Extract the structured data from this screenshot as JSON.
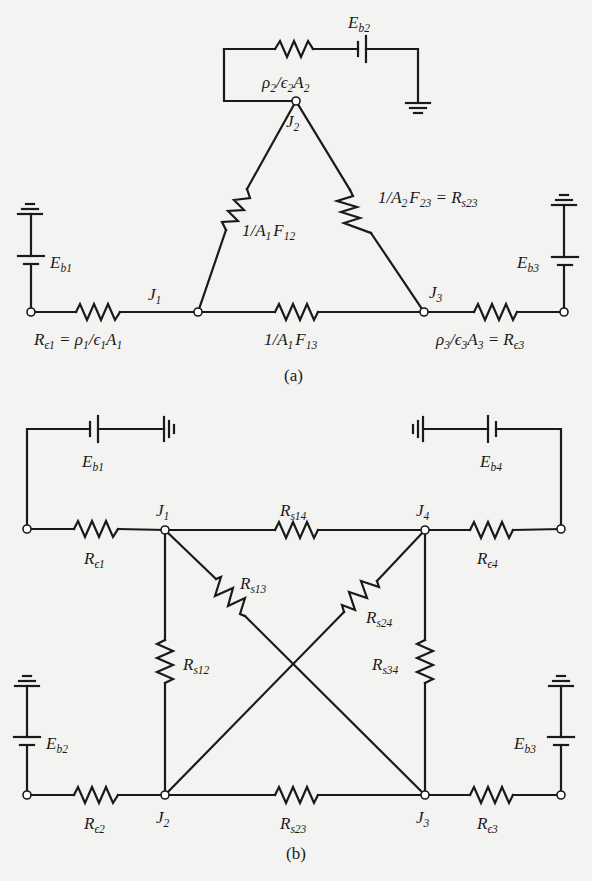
{
  "diagram_a": {
    "caption": "(a)",
    "nodes": {
      "J1": {
        "main": "J",
        "sub": "1"
      },
      "J2": {
        "main": "J",
        "sub": "2"
      },
      "J3": {
        "main": "J",
        "sub": "3"
      }
    },
    "batteries": {
      "Eb1": {
        "main": "E",
        "sub": "b1"
      },
      "Eb2": {
        "main": "E",
        "sub": "b2"
      },
      "Eb3": {
        "main": "E",
        "sub": "b3"
      }
    },
    "resistors": {
      "surface2": {
        "text": "ρ₂/ϵ₂A₂",
        "parts": [
          "ρ",
          "2",
          "/ϵ",
          "2",
          "A",
          "2"
        ]
      },
      "R12": {
        "parts": [
          "1/A",
          "1",
          "F",
          "12"
        ]
      },
      "R23": {
        "parts": [
          "1/A",
          "2",
          "F",
          "23",
          " = R",
          "s23"
        ]
      },
      "R13": {
        "parts": [
          "1/A",
          "1",
          "F",
          "13"
        ]
      },
      "surface1": {
        "parts": [
          "R",
          "ϵ1",
          " = ρ",
          "1",
          "/ϵ",
          "1",
          "A",
          "1"
        ]
      },
      "surface3": {
        "parts": [
          "ρ",
          "3",
          "/ϵ",
          "3",
          "A",
          "3",
          " = R",
          "ϵ3"
        ]
      }
    }
  },
  "diagram_b": {
    "caption": "(b)",
    "nodes": {
      "J1": {
        "main": "J",
        "sub": "1"
      },
      "J2": {
        "main": "J",
        "sub": "2"
      },
      "J3": {
        "main": "J",
        "sub": "3"
      },
      "J4": {
        "main": "J",
        "sub": "4"
      }
    },
    "batteries": {
      "Eb1": {
        "main": "E",
        "sub": "b1"
      },
      "Eb2": {
        "main": "E",
        "sub": "b2"
      },
      "Eb3": {
        "main": "E",
        "sub": "b3"
      },
      "Eb4": {
        "main": "E",
        "sub": "b4"
      }
    },
    "resistors": {
      "Re1": {
        "main": "R",
        "sub": "ϵ1"
      },
      "Re2": {
        "main": "R",
        "sub": "ϵ2"
      },
      "Re3": {
        "main": "R",
        "sub": "ϵ3"
      },
      "Re4": {
        "main": "R",
        "sub": "ϵ4"
      },
      "Rs12": {
        "main": "R",
        "sub": "s12"
      },
      "Rs13": {
        "main": "R",
        "sub": "s13"
      },
      "Rs14": {
        "main": "R",
        "sub": "s14"
      },
      "Rs23": {
        "main": "R",
        "sub": "s23"
      },
      "Rs24": {
        "main": "R",
        "sub": "s24"
      },
      "Rs34": {
        "main": "R",
        "sub": "s34"
      }
    }
  }
}
